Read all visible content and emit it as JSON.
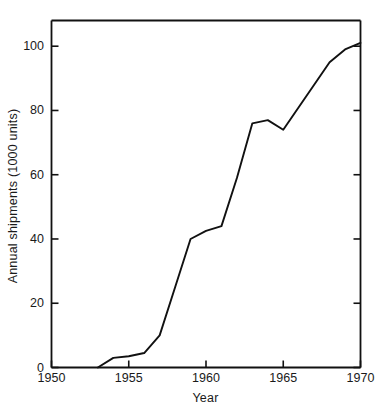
{
  "chart_data": {
    "type": "line",
    "title": "",
    "xlabel": "Year",
    "ylabel": "Annual shipments (1000 units)",
    "xlim": [
      1950,
      1970
    ],
    "ylim": [
      0,
      108
    ],
    "grid": false,
    "legend": "none",
    "xticks": [
      1950,
      1955,
      1960,
      1965,
      1970
    ],
    "xtick_labels": [
      "1950",
      "1955",
      "1960",
      "1965",
      "1970"
    ],
    "yticks": [
      0,
      20,
      40,
      60,
      80,
      100
    ],
    "ytick_labels": [
      "0",
      "20",
      "40",
      "60",
      "80",
      "100"
    ],
    "line_color": "#111111",
    "series": [
      {
        "name": "Annual shipments",
        "x": [
          1953,
          1954,
          1955,
          1956,
          1957,
          1958,
          1959,
          1960,
          1961,
          1962,
          1963,
          1964,
          1965,
          1966,
          1967,
          1968,
          1969,
          1970
        ],
        "values": [
          0,
          3,
          3.5,
          4.5,
          10,
          25,
          40,
          42.5,
          44,
          59,
          76,
          77,
          74,
          81,
          88,
          95,
          99,
          101
        ]
      }
    ]
  },
  "axes": {
    "x_axis_name": "Year",
    "y_axis_name": "Annual shipments (1000 units)"
  }
}
